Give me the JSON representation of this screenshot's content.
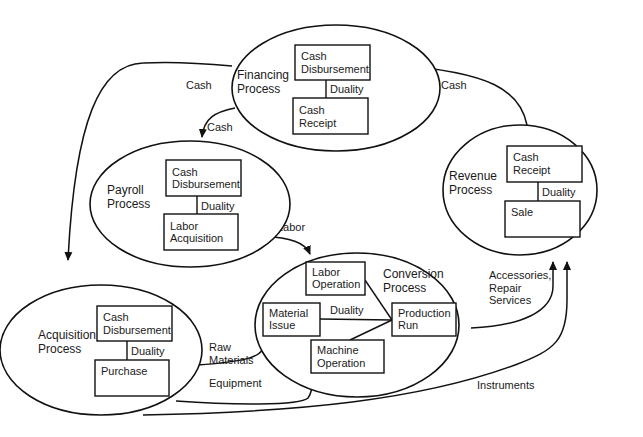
{
  "processes": {
    "financing": {
      "label": [
        "Financing",
        "Process"
      ],
      "top": [
        "Cash",
        "Disbursement"
      ],
      "bottom": [
        "Cash",
        "Receipt"
      ],
      "duality": "Duality"
    },
    "payroll": {
      "label": [
        "Payroll",
        "Process"
      ],
      "top": [
        "Cash",
        "Disbursement"
      ],
      "bottom": [
        "Labor",
        "Acquisition"
      ],
      "duality": "Duality"
    },
    "revenue": {
      "label": [
        "Revenue",
        "Process"
      ],
      "top": [
        "Cash",
        "Receipt"
      ],
      "bottom": [
        "Sale"
      ],
      "duality": "Duality"
    },
    "acquisition": {
      "label": [
        "Acquisition",
        "Process"
      ],
      "top": [
        "Cash",
        "Disbursement"
      ],
      "bottom": [
        "Purchase"
      ],
      "duality": "Duality"
    },
    "conversion": {
      "label": [
        "Conversion",
        "Process"
      ],
      "labor_operation": [
        "Labor",
        "Operation"
      ],
      "material_issue": [
        "Material",
        "Issue"
      ],
      "machine_operation": [
        "Machine",
        "Operation"
      ],
      "production_run": [
        "Production",
        "Run"
      ],
      "duality": "Duality"
    }
  },
  "flows": {
    "financing_to_acquisition": "Cash",
    "financing_to_payroll": "Cash",
    "revenue_to_financing": "Cash",
    "payroll_to_conversion": "Labor",
    "acquisition_raw": [
      "Raw",
      "Materials"
    ],
    "acquisition_equipment": "Equipment",
    "conversion_to_revenue": [
      "Accessories,",
      "Repair",
      "Services"
    ],
    "acquisition_to_revenue": "Instruments"
  }
}
